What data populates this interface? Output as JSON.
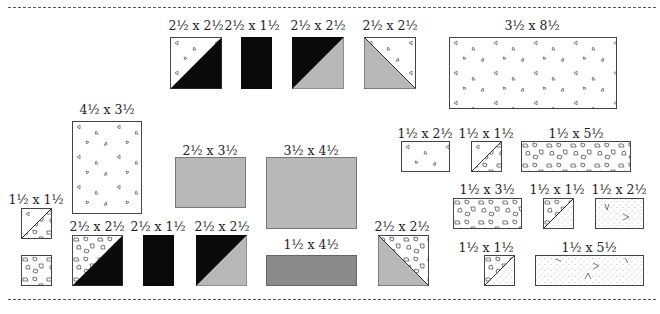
{
  "diagram": {
    "type": "fabric cutting layout",
    "colors": {
      "black": "#0a0a0a",
      "light_gray": "#b8b8b8",
      "dark_gray": "#8a8a8a",
      "white": "#ffffff",
      "outline": "#444444"
    },
    "pieces": [
      {
        "id": "p1",
        "label": "2½ x 2½",
        "fill": "hst-white-print-black"
      },
      {
        "id": "p2",
        "label": "2½ x 1½",
        "fill": "black"
      },
      {
        "id": "p3",
        "label": "2½ x 2½",
        "fill": "hst-black-gray"
      },
      {
        "id": "p4",
        "label": "2½ x 2½",
        "fill": "hst-gray-white-print"
      },
      {
        "id": "p5",
        "label": "3½ x 8½",
        "fill": "white-print"
      },
      {
        "id": "p6",
        "label": "4½ x 3½",
        "fill": "white-print"
      },
      {
        "id": "p7",
        "label": "2½ x 3½",
        "fill": "light-gray"
      },
      {
        "id": "p8",
        "label": "3½ x 4½",
        "fill": "light-gray"
      },
      {
        "id": "p9",
        "label": "1½ x 2½",
        "fill": "white-print"
      },
      {
        "id": "p10",
        "label": "1½ x 1½",
        "fill": "hst-white-print-confetti"
      },
      {
        "id": "p11",
        "label": "1½ x 5½",
        "fill": "confetti"
      },
      {
        "id": "p12",
        "label": "1½ x 1½",
        "fill": "hst-white-print-confetti"
      },
      {
        "id": "p13",
        "label": "2½ x 2½",
        "fill": "hst-confetti-black"
      },
      {
        "id": "p14",
        "label": "2½ x 1½",
        "fill": "black"
      },
      {
        "id": "p15",
        "label": "2½ x 2½",
        "fill": "hst-black-gray"
      },
      {
        "id": "p16",
        "label": "1½ x 4½",
        "fill": "dark-gray"
      },
      {
        "id": "p17",
        "label": "2½ x 2½",
        "fill": "hst-gray-confetti"
      },
      {
        "id": "p18",
        "label": "1½ x 3½",
        "fill": "confetti"
      },
      {
        "id": "p19",
        "label": "1½ x 1½",
        "fill": "hst-confetti-dots"
      },
      {
        "id": "p20",
        "label": "1½ x 2½",
        "fill": "dots"
      },
      {
        "id": "p21",
        "label": "1½ x 1½",
        "fill": "hst-confetti-dots"
      },
      {
        "id": "p22",
        "label": "1½ x 5½",
        "fill": "dots"
      },
      {
        "id": "p23",
        "label": "",
        "fill": "confetti"
      }
    ]
  }
}
